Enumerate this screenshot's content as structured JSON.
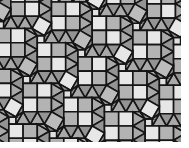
{
  "canvas": {
    "width": 189,
    "height": 148,
    "background": "#ffffff"
  },
  "pattern_area": {
    "x": 0,
    "y": 0,
    "width": 181,
    "height": 142
  },
  "tiling": {
    "description": "square-triangle tessellation with 2x2 checkerboard square blocks, triangle strips and tilted squares",
    "unit": 14.2,
    "origin": [
      25,
      2
    ],
    "lattice_u": [
      2.866,
      1
    ],
    "lattice_v": [
      -1,
      2.866
    ],
    "i_range": [
      -2,
      6
    ],
    "j_range": [
      -2,
      4
    ],
    "stroke": "#151515",
    "stroke_width": 1.6,
    "colors": {
      "light": "#e7e7e7",
      "mid": "#b3b3b3",
      "tri1": "#a9a9a9",
      "tri2": "#949494",
      "tiltSq": "#bcbcbc",
      "smallSq": "#e0e0e0"
    },
    "cell_polys": [
      {
        "pts": [
          [
            -1,
            -1
          ],
          [
            0,
            -1
          ],
          [
            0,
            0
          ],
          [
            -1,
            0
          ]
        ],
        "fill": "light",
        "altFill": "mid"
      },
      {
        "pts": [
          [
            0,
            -1
          ],
          [
            1,
            -1
          ],
          [
            1,
            0
          ],
          [
            0,
            0
          ]
        ],
        "fill": "mid",
        "altFill": "light"
      },
      {
        "pts": [
          [
            -1,
            0
          ],
          [
            0,
            0
          ],
          [
            0,
            1
          ],
          [
            -1,
            1
          ]
        ],
        "fill": "mid",
        "altFill": "light"
      },
      {
        "pts": [
          [
            0,
            0
          ],
          [
            1,
            0
          ],
          [
            1,
            1
          ],
          [
            0,
            1
          ]
        ],
        "fill": "light",
        "altFill": "mid"
      },
      {
        "pts": [
          [
            1,
            -1
          ],
          [
            1,
            0
          ],
          [
            1.866,
            -0.5
          ]
        ],
        "fill": "tri1"
      },
      {
        "pts": [
          [
            1.866,
            -0.5
          ],
          [
            1.866,
            0.5
          ],
          [
            1,
            0
          ]
        ],
        "fill": "tri2"
      },
      {
        "pts": [
          [
            1,
            0
          ],
          [
            1,
            1
          ],
          [
            1.866,
            0.5
          ]
        ],
        "fill": "tri1"
      },
      {
        "pts": [
          [
            1.866,
            0.5
          ],
          [
            1.866,
            1.5
          ],
          [
            1,
            1
          ]
        ],
        "fill": "tri2"
      },
      {
        "pts": [
          [
            1,
            1
          ],
          [
            0,
            1
          ],
          [
            0.5,
            1.866
          ]
        ],
        "fill": "tri2"
      },
      {
        "pts": [
          [
            0.5,
            1.866
          ],
          [
            -0.5,
            1.866
          ],
          [
            0,
            1
          ]
        ],
        "fill": "tri1"
      },
      {
        "pts": [
          [
            0,
            1
          ],
          [
            -1,
            1
          ],
          [
            -0.5,
            1.866
          ]
        ],
        "fill": "tri2"
      },
      {
        "pts": [
          [
            -0.5,
            1.866
          ],
          [
            -1.5,
            1.866
          ],
          [
            -1,
            1
          ]
        ],
        "fill": "tri1"
      },
      {
        "pts": [
          [
            -1.866,
            0
          ],
          [
            -1,
            0.5
          ],
          [
            -1.5,
            1.366
          ],
          [
            -2.366,
            0.866
          ]
        ],
        "fill": "tiltSq",
        "altFill": "light"
      },
      {
        "pts": [
          [
            -1.5,
            1.866
          ],
          [
            -2,
            1.866
          ],
          [
            -2,
            1.366
          ],
          [
            -1.5,
            1.366
          ]
        ],
        "fill": "smallSq"
      },
      {
        "pts": [
          [
            -1,
            0.5
          ],
          [
            -1,
            1
          ],
          [
            -1.5,
            1.366
          ]
        ],
        "fill": "tri2"
      },
      {
        "pts": [
          [
            -1,
            1
          ],
          [
            -1.5,
            1.866
          ],
          [
            -1.5,
            1.366
          ]
        ],
        "fill": "tri1"
      },
      {
        "pts": [
          [
            -2,
            1.366
          ],
          [
            -2.866,
            0.866
          ],
          [
            -2.366,
            0.866
          ]
        ],
        "fill": "tri1"
      },
      {
        "pts": [
          [
            -2,
            1.366
          ],
          [
            -2.366,
            0.866
          ],
          [
            -1.5,
            1.366
          ]
        ],
        "fill": "tri2"
      }
    ]
  }
}
